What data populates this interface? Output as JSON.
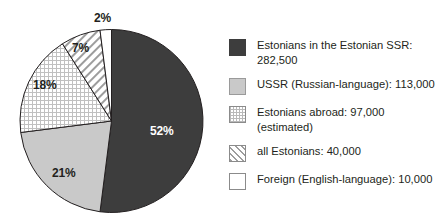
{
  "chart_data": {
    "type": "pie",
    "title": "",
    "categories": [
      "Estonians in the Estonian SSR",
      "USSR (Russian-language)",
      "Estonians abroad (estimated)",
      "all Estonians",
      "Foreign (English-language)"
    ],
    "values": [
      282500,
      113000,
      97000,
      40000,
      10000
    ],
    "percent_labels": [
      "52%",
      "21%",
      "18%",
      "7%",
      "2%"
    ],
    "percents": [
      52,
      21,
      18,
      7,
      2
    ],
    "legend_position": "right",
    "grid": false,
    "start_angle_deg": 0,
    "direction": "clockwise",
    "slice_fills": [
      "#3d3d3d",
      "#c9c9c9",
      "dotted-grid",
      "diagonal-hatch",
      "#ffffff"
    ]
  },
  "pie": {
    "labels": [
      {
        "text": "52%",
        "on_dark": true,
        "left": 150,
        "top": 124
      },
      {
        "text": "21%",
        "on_dark": false,
        "left": 52,
        "top": 166
      },
      {
        "text": "18%",
        "on_dark": false,
        "left": 33,
        "top": 78
      },
      {
        "text": "7%",
        "on_dark": false,
        "left": 72,
        "top": 41
      },
      {
        "text": "2%",
        "on_dark": false,
        "left": 94,
        "top": 11
      }
    ]
  },
  "legend": {
    "items": [
      {
        "swatch": "sw-dark",
        "swatch_name": "dark-gray-solid",
        "line1": "Estonians in the Estonian SSR:",
        "line2": "282,500"
      },
      {
        "swatch": "sw-gray",
        "swatch_name": "light-gray-solid",
        "line1": "USSR (Russian-language): 113,000",
        "line2": ""
      },
      {
        "swatch": "sw-dots",
        "swatch_name": "dotted-grid",
        "line1": "Estonians abroad: 97,000",
        "line2": "(estimated)"
      },
      {
        "swatch": "sw-hatch",
        "swatch_name": "diagonal-hatch",
        "line1": "all Estonians: 40,000",
        "line2": ""
      },
      {
        "swatch": "sw-white",
        "swatch_name": "white-solid",
        "line1": "Foreign (English-language): 10,000",
        "line2": ""
      }
    ]
  },
  "colors": {
    "dark": "#3d3d3d",
    "gray": "#c9c9c9",
    "white": "#ffffff",
    "outline": "#231f20",
    "text": "#231f20"
  }
}
